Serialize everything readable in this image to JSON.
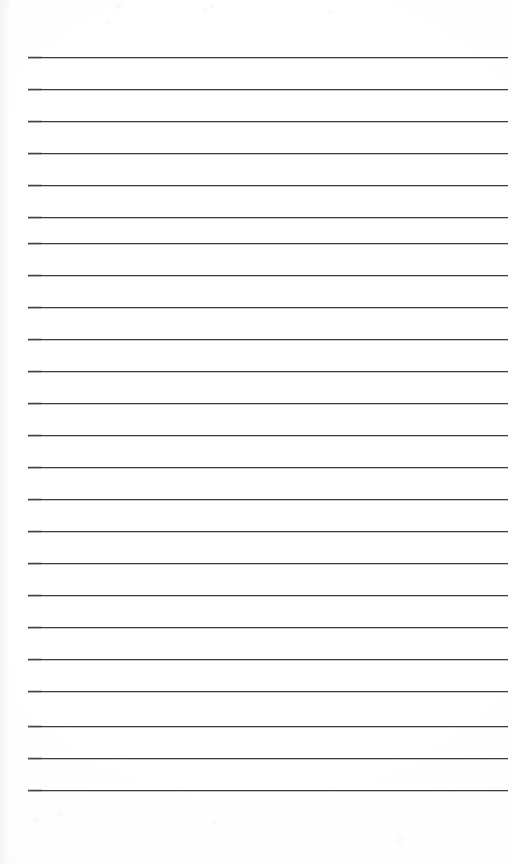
{
  "document": {
    "kind": "lined-notebook-page",
    "title": "Blank Ruled Page",
    "content_text": "",
    "written_lines": [
      "",
      "",
      "",
      "",
      "",
      "",
      "",
      "",
      "",
      "",
      "",
      "",
      "",
      "",
      "",
      "",
      "",
      "",
      "",
      "",
      "",
      "",
      "",
      ""
    ]
  },
  "page": {
    "width": 512,
    "height": 864,
    "background_color": "#fdfdfe",
    "paper_tone_color": "#fbfbfc"
  },
  "ruling": {
    "line_count": 24,
    "line_color": "#3a3a3e",
    "line_thickness": 1,
    "line_left": 28,
    "line_right": 508,
    "line_width": 480,
    "first_line_y": 57,
    "line_spacing": 32,
    "last_line_y": 790,
    "line_y_positions": [
      57,
      89,
      121,
      153,
      185,
      217,
      243,
      275,
      307,
      339,
      371,
      403,
      435,
      467,
      499,
      531,
      563,
      595,
      627,
      659,
      691,
      726,
      758,
      790
    ]
  },
  "margins": {
    "top": 57,
    "left": 28,
    "right": 4,
    "bottom": 74
  }
}
